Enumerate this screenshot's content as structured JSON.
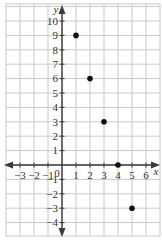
{
  "chart_data": {
    "type": "scatter",
    "title": "",
    "xlabel": "x",
    "ylabel": "y",
    "xlim": [
      -4,
      7
    ],
    "ylim": [
      -5,
      11
    ],
    "grid": true,
    "x_ticks": [
      -3,
      -2,
      -1,
      0,
      1,
      2,
      3,
      4,
      5,
      6
    ],
    "y_ticks": [
      -4,
      -3,
      -2,
      -1,
      1,
      2,
      3,
      4,
      5,
      6,
      7,
      8,
      9,
      10
    ],
    "origin_label": "0",
    "points": [
      {
        "x": 1,
        "y": 9
      },
      {
        "x": 2,
        "y": 6
      },
      {
        "x": 3,
        "y": 3
      },
      {
        "x": 4,
        "y": 0
      },
      {
        "x": 5,
        "y": -3
      }
    ],
    "colors": {
      "grid": "#c8c8c8",
      "axis": "#3a3a3a",
      "point": "#111111"
    }
  }
}
